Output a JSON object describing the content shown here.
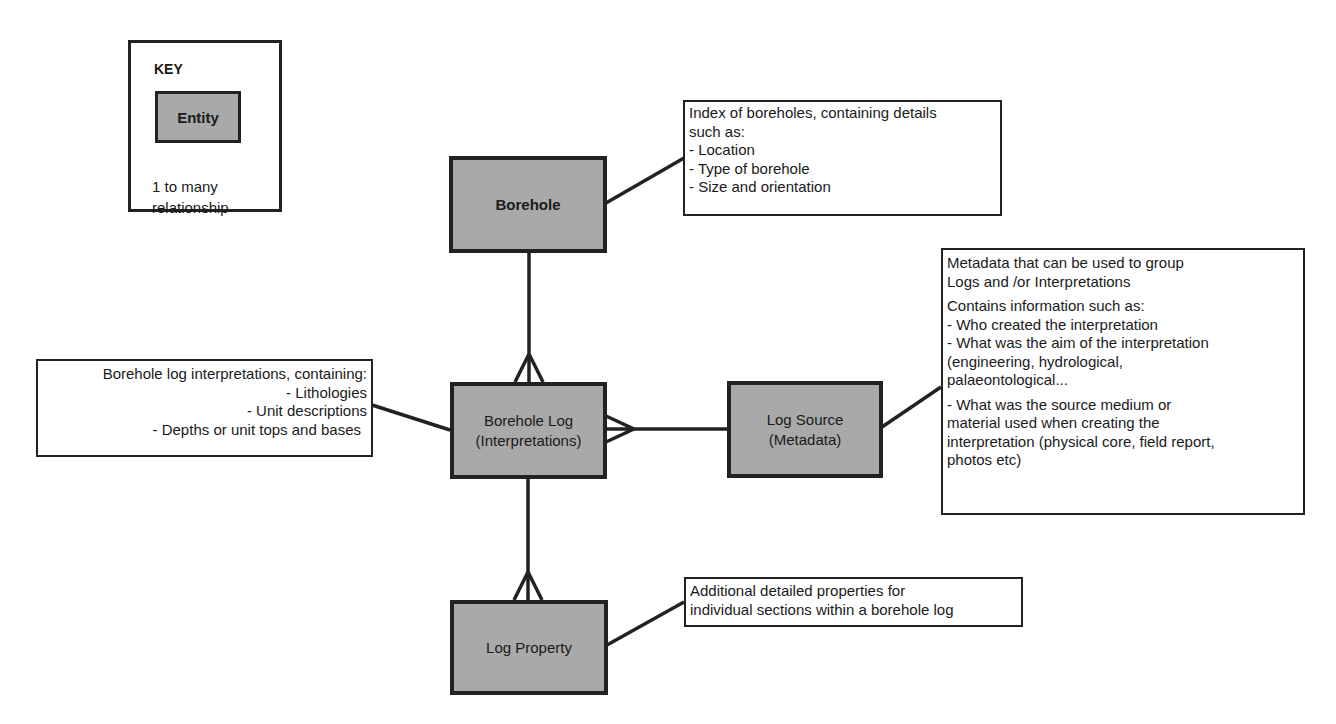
{
  "key": {
    "title": "KEY",
    "entity_label": "Entity",
    "relationship_label": "1 to many\nrelationship"
  },
  "entities": {
    "borehole": "Borehole",
    "borehole_log_line1": "Borehole Log",
    "borehole_log_line2": "(Interpretations)",
    "log_source_line1": "Log Source",
    "log_source_line2": "(Metadata)",
    "log_property": "Log Property"
  },
  "notes": {
    "borehole": {
      "lines": [
        "Index of boreholes, containing details",
        "such as:",
        "- Location",
        "- Type of borehole",
        "- Size and orientation"
      ]
    },
    "borehole_log": {
      "lines": [
        "Borehole log interpretations, containing:",
        "- Lithologies",
        "- Unit descriptions",
        "- Depths or unit tops and bases"
      ]
    },
    "log_source": {
      "para1": [
        "Metadata that can be used to group",
        "Logs and /or Interpretations"
      ],
      "para2": [
        "Contains information such as:",
        "- Who created the interpretation",
        "- What was the aim of the interpretation",
        "(engineering, hydrological,",
        "palaeontological..."
      ],
      "para3": [
        "- What was the source medium or",
        "material used when creating the",
        "interpretation (physical core, field report,",
        "photos etc)"
      ]
    },
    "log_property": {
      "lines": [
        "Additional detailed properties for",
        "individual sections within a borehole log"
      ]
    }
  },
  "relationships": [
    {
      "from": "Borehole",
      "to": "Borehole Log (Interpretations)",
      "type": "1 to many"
    },
    {
      "from": "Log Source (Metadata)",
      "to": "Borehole Log (Interpretations)",
      "type": "1 to many"
    },
    {
      "from": "Borehole Log (Interpretations)",
      "to": "Log Property",
      "type": "1 to many"
    }
  ],
  "colors": {
    "entity_fill": "#a9a9a9",
    "stroke": "#222222",
    "background": "#ffffff"
  }
}
